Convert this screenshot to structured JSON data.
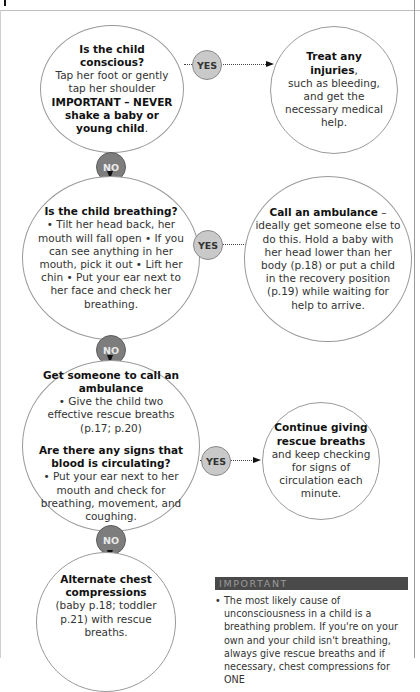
{
  "flowchart": {
    "nodes": {
      "conscious": {
        "title": "Is the child conscious?",
        "line1": "Tap her foot or gently tap her shoulder",
        "warning": "IMPORTANT – NEVER shake a baby or young child",
        "end": "."
      },
      "treat": {
        "title": "Treat any injuries",
        "comma": ",",
        "text": "such as bleeding, and get the necessary medical help."
      },
      "breathing": {
        "title": "Is the child breathing?",
        "text": "• Tilt her head back, her mouth will fall open • If you can see anything in her mouth, pick it out • Lift her chin • Put your ear next to her face and check her breathing."
      },
      "ambulance": {
        "title": "Call an ambulance",
        "dash": " –",
        "text": "ideally get someone else to do this. Hold a baby with her head lower than her body (p.18) or put a child in the recovery position (p.19) while waiting for help to arrive."
      },
      "circulating": {
        "title1": "Get someone to call an ambulance",
        "text1": "• Give the child two effective rescue breaths (p.17; p.20)",
        "title2": "Are there any signs that blood is circulating?",
        "text2": "• Put your ear next to her mouth and check for breathing, movement, and coughing."
      },
      "continue": {
        "title": "Continue giving rescue breaths",
        "text": "and keep checking for signs of circulation each minute."
      },
      "compressions": {
        "title": "Alternate chest compressions",
        "text": "(baby p.18; toddler p.21) with rescue breaths."
      }
    },
    "labels": {
      "yes": "YES",
      "no": "NO"
    }
  },
  "important": {
    "heading": "IMPORTANT",
    "bullet": "•",
    "text": "The most likely cause of unconsciousness in a child is a breathing problem. If you're on your own and your child isn't breathing, always give rescue breaths and if necessary, chest compressions for ONE"
  }
}
